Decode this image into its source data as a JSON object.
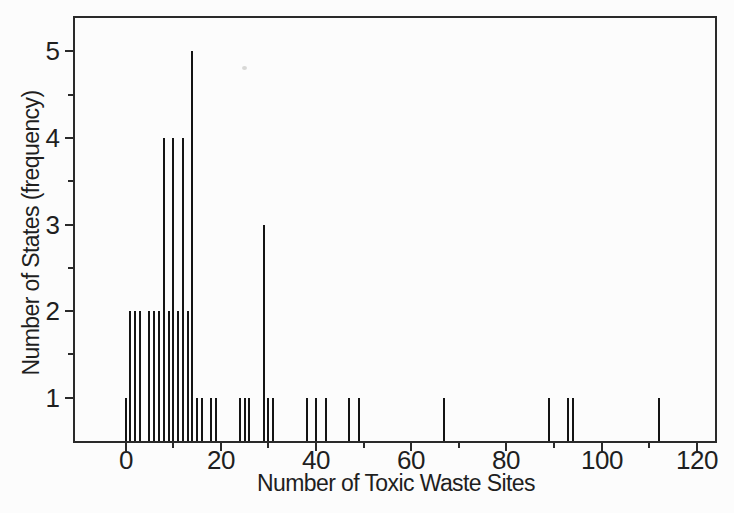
{
  "figure": {
    "background_color": "#fcfcfc",
    "ink_color": "#2a2a2a",
    "spike_color": "#141414",
    "text_color": "#1f1f1f"
  },
  "chart_data": {
    "type": "bar",
    "subtype": "spike-histogram",
    "title": "",
    "xlabel": "Number of Toxic Waste Sites",
    "ylabel": "Number of States (frequency)",
    "x": [
      0,
      1,
      2,
      3,
      5,
      6,
      7,
      8,
      9,
      10,
      11,
      12,
      13,
      14,
      15,
      16,
      18,
      19,
      24,
      25,
      26,
      29,
      30,
      31,
      38,
      40,
      42,
      47,
      49,
      67,
      89,
      93,
      94,
      112
    ],
    "values": [
      1,
      2,
      2,
      2,
      2,
      2,
      2,
      4,
      2,
      4,
      2,
      4,
      2,
      5,
      1,
      1,
      1,
      1,
      1,
      1,
      1,
      3,
      1,
      1,
      1,
      1,
      1,
      1,
      1,
      1,
      1,
      1,
      1,
      1
    ],
    "xlim": [
      -11,
      124
    ],
    "ylim": [
      0.5,
      5.41
    ],
    "x_ticks_major": [
      0,
      20,
      40,
      60,
      80,
      100,
      120
    ],
    "x_ticks_minor": [
      10,
      30,
      50,
      70,
      90,
      110
    ],
    "y_ticks_major": [
      1,
      2,
      3,
      4,
      5
    ],
    "y_ticks_minor": [
      1.5,
      2.5,
      3.5,
      4.5
    ],
    "x_tick_labels": [
      "0",
      "20",
      "40",
      "60",
      "80",
      "100",
      "120"
    ],
    "y_tick_labels": [
      "1",
      "2",
      "3",
      "4",
      "5"
    ],
    "grid": false,
    "legend": false
  }
}
